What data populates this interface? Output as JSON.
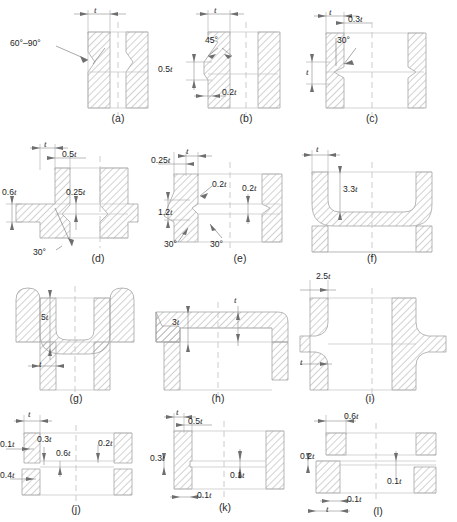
{
  "figure": {
    "kind": "engineering-cross-section-plate",
    "symbol_t": "t",
    "panel_count": 12
  },
  "colors": {
    "hatch_line": "#8c8c8c",
    "outline": "#b4b4b4",
    "centerline": "#c0c0c0",
    "dimension": "#6e6e6e",
    "text": "#1e1e1e",
    "background": "#ffffff"
  },
  "panels": [
    {
      "id": "a",
      "caption": "(a)",
      "labels": [
        {
          "name": "thickness-t",
          "text": "t",
          "italic": true
        },
        {
          "name": "angle-60-90",
          "text": "60°–90°",
          "italic": false
        }
      ]
    },
    {
      "id": "b",
      "caption": "(b)",
      "labels": [
        {
          "name": "thickness-t",
          "text": "t",
          "italic": true
        },
        {
          "name": "angle-45",
          "text": "45°",
          "italic": false
        },
        {
          "name": "dim-0-5t",
          "text": "0.5t",
          "italic": true
        },
        {
          "name": "dim-0-2t",
          "text": "0.2t",
          "italic": true
        }
      ]
    },
    {
      "id": "c",
      "caption": "(c)",
      "labels": [
        {
          "name": "thickness-t-top",
          "text": "t",
          "italic": true
        },
        {
          "name": "dim-0-3t",
          "text": "0.3t",
          "italic": true
        },
        {
          "name": "angle-30",
          "text": "30°",
          "italic": false
        },
        {
          "name": "thickness-t-left",
          "text": "t",
          "italic": true
        }
      ]
    },
    {
      "id": "d",
      "caption": "(d)",
      "labels": [
        {
          "name": "thickness-t",
          "text": "t",
          "italic": true
        },
        {
          "name": "dim-0-5t",
          "text": "0.5t",
          "italic": true
        },
        {
          "name": "dim-0-6t",
          "text": "0.6t",
          "italic": true
        },
        {
          "name": "dim-0-25t",
          "text": "0.25t",
          "italic": true
        },
        {
          "name": "angle-30",
          "text": "30°",
          "italic": false
        }
      ]
    },
    {
      "id": "e",
      "caption": "(e)",
      "labels": [
        {
          "name": "thickness-t",
          "text": "t",
          "italic": true
        },
        {
          "name": "dim-0-25t",
          "text": "0.25t",
          "italic": true
        },
        {
          "name": "dim-0-2t-left",
          "text": "0.2t",
          "italic": true
        },
        {
          "name": "dim-0-2t-right",
          "text": "0.2t",
          "italic": true
        },
        {
          "name": "dim-1-2t",
          "text": "1.2t",
          "italic": true
        },
        {
          "name": "angle-30-left",
          "text": "30°",
          "italic": false
        },
        {
          "name": "angle-30-right",
          "text": "30°",
          "italic": false
        }
      ]
    },
    {
      "id": "f",
      "caption": "(f)",
      "labels": [
        {
          "name": "thickness-t",
          "text": "t",
          "italic": true
        },
        {
          "name": "dim-3-3t",
          "text": "3.3t",
          "italic": true
        }
      ]
    },
    {
      "id": "g",
      "caption": "(g)",
      "labels": [
        {
          "name": "dim-5t",
          "text": "5t",
          "italic": true
        },
        {
          "name": "thickness-t",
          "text": "t",
          "italic": true
        }
      ]
    },
    {
      "id": "h",
      "caption": "(h)",
      "labels": [
        {
          "name": "thickness-t",
          "text": "t",
          "italic": true
        },
        {
          "name": "dim-3t",
          "text": "3t",
          "italic": true
        }
      ]
    },
    {
      "id": "i",
      "caption": "(i)",
      "labels": [
        {
          "name": "dim-2-5t",
          "text": "2.5t",
          "italic": true
        },
        {
          "name": "thickness-t",
          "text": "t",
          "italic": true
        }
      ]
    },
    {
      "id": "j",
      "caption": "(j)",
      "labels": [
        {
          "name": "thickness-t",
          "text": "t",
          "italic": true
        },
        {
          "name": "dim-0-1t",
          "text": "0.1t",
          "italic": true
        },
        {
          "name": "dim-0-3t",
          "text": "0.3t",
          "italic": true
        },
        {
          "name": "dim-0-6t",
          "text": "0.6t",
          "italic": true
        },
        {
          "name": "dim-0-2t",
          "text": "0.2t",
          "italic": true
        },
        {
          "name": "dim-0-4t",
          "text": "0.4t",
          "italic": true
        }
      ]
    },
    {
      "id": "k",
      "caption": "(k)",
      "labels": [
        {
          "name": "thickness-t",
          "text": "t",
          "italic": true
        },
        {
          "name": "dim-0-5t",
          "text": "0.5t",
          "italic": true
        },
        {
          "name": "dim-0-3t",
          "text": "0.3t",
          "italic": true
        },
        {
          "name": "dim-0-1t-bottom",
          "text": "0.1t",
          "italic": true
        },
        {
          "name": "dim-0-1t-right",
          "text": "0.1t",
          "italic": true
        }
      ]
    },
    {
      "id": "l",
      "caption": "(l)",
      "labels": [
        {
          "name": "dim-0-6t",
          "text": "0.6t",
          "italic": true
        },
        {
          "name": "dim-0-2t",
          "text": "0.2t",
          "italic": true
        },
        {
          "name": "dim-0-1t-left",
          "text": "0.1t",
          "italic": true
        },
        {
          "name": "dim-0-1t-right",
          "text": "0.1t",
          "italic": true
        },
        {
          "name": "thickness-t",
          "text": "t",
          "italic": true
        }
      ]
    }
  ]
}
